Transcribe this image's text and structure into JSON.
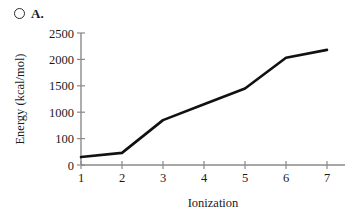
{
  "option": {
    "marker_icon": "radio-unselected-icon",
    "letter": "A.",
    "selected": false
  },
  "chart_data": {
    "type": "line",
    "title": "",
    "xlabel": "Ionization",
    "ylabel": "Energy (kcal/mol)",
    "x": [
      1,
      2,
      3,
      4,
      5,
      6,
      7
    ],
    "values": [
      150,
      230,
      850,
      1150,
      1450,
      2030,
      2180
    ],
    "series": [
      {
        "name": "Ionization energy",
        "values": [
          150,
          230,
          850,
          1150,
          1450,
          2030,
          2180
        ],
        "color": "#111111"
      }
    ],
    "xticks": [
      "1",
      "2",
      "3",
      "4",
      "5",
      "6",
      "7"
    ],
    "yticks": [
      "0",
      "100",
      "1000",
      "1500",
      "2000",
      "2500"
    ],
    "ytick_positions": [
      0,
      500,
      1000,
      1500,
      2000,
      2500
    ],
    "xlim": [
      1,
      7
    ],
    "ylim": [
      0,
      2500
    ],
    "grid": false,
    "legend": false,
    "axis_color": "#8a8a8a",
    "line_color": "#111111"
  }
}
